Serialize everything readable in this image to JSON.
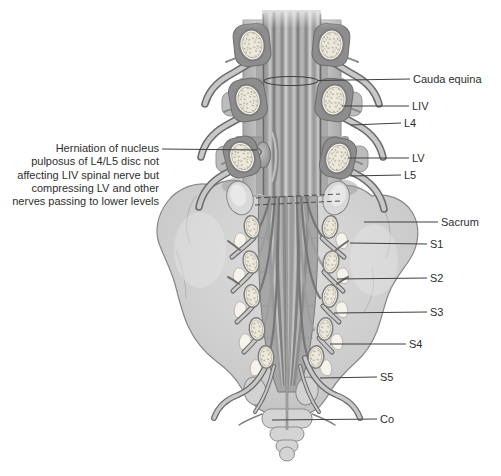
{
  "labels": {
    "cauda_equina": "Cauda equina",
    "liv": "LIV",
    "l4": "L4",
    "lv": "LV",
    "l5": "L5",
    "sacrum": "Sacrum",
    "s1": "S1",
    "s2": "S2",
    "s3": "S3",
    "s4": "S4",
    "s5": "S5",
    "co": "Co"
  },
  "annotation": {
    "lines": [
      "Herniation of nucleus",
      "pulposus of L4/L5 disc not",
      "affecting LIV spinal nerve but",
      "compressing LV and other",
      "nerves passing to lower levels"
    ]
  },
  "colors": {
    "background": "#ffffff",
    "bone": "#cfcfcf",
    "bone_outline": "#878787",
    "trabecular_bone": "#ece8db",
    "nerve_dark": "#6a6a6a",
    "nerve_light": "#c8c8c8",
    "leader_line": "#3f3f3f",
    "label_text": "#2e2e2e"
  }
}
